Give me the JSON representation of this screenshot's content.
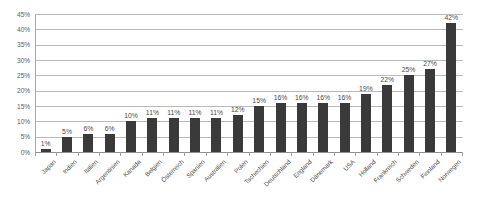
{
  "chart_data": {
    "type": "bar",
    "title": "",
    "subtitle": "",
    "xlabel": "",
    "ylabel": "",
    "ylim": [
      0,
      45
    ],
    "ytick_step": 5,
    "ytick_labels": [
      "0%",
      "5%",
      "10%",
      "15%",
      "20%",
      "25%",
      "30%",
      "35%",
      "40%",
      "45%"
    ],
    "grid": true,
    "legend": "none",
    "series_color": "#3a3a3a",
    "gridline_color": "#b9b9b9",
    "value_suffix": "%",
    "categories": [
      "Japan",
      "Indien",
      "Italien",
      "Argentinien",
      "Kanada",
      "Belgien",
      "Österreich",
      "Spanien",
      "Australien",
      "Polen",
      "Tschechien",
      "Deutschland",
      "England",
      "Dänemark",
      "USA",
      "Holland",
      "Frankreich",
      "Schweden",
      "Finnland",
      "Norwegen"
    ],
    "values": [
      1,
      5,
      6,
      6,
      10,
      11,
      11,
      11,
      11,
      12,
      15,
      16,
      16,
      16,
      16,
      19,
      22,
      25,
      27,
      42
    ],
    "value_labels": [
      "1%",
      "5%",
      "6%",
      "6%",
      "10%",
      "11%",
      "11%",
      "11%",
      "11%",
      "12%",
      "15%",
      "16%",
      "16%",
      "16%",
      "16%",
      "19%",
      "22%",
      "25%",
      "27%",
      "42%"
    ]
  }
}
